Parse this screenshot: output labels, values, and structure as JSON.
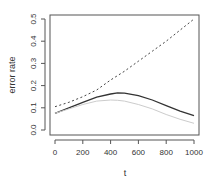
{
  "chart_data": {
    "type": "line",
    "title": "",
    "xlabel": "t",
    "ylabel": "error rate",
    "xlim": [
      0,
      1000
    ],
    "ylim": [
      0,
      0.5
    ],
    "xticks": [
      0,
      200,
      400,
      600,
      800,
      1000
    ],
    "yticks": [
      0.0,
      0.1,
      0.2,
      0.3,
      0.4,
      0.5
    ],
    "xtick_labels": [
      "0",
      "200",
      "400",
      "600",
      "800",
      "1000"
    ],
    "ytick_labels": [
      "0.0",
      "0.1",
      "0.2",
      "0.3",
      "0.4",
      "0.5"
    ],
    "grid": false,
    "legend": null,
    "x": [
      0,
      100,
      200,
      300,
      400,
      450,
      500,
      600,
      700,
      800,
      900,
      1000
    ],
    "series": [
      {
        "name": "dashed",
        "style": "dashed",
        "color": "#444444",
        "values": [
          0.105,
          0.125,
          0.15,
          0.18,
          0.225,
          0.245,
          0.265,
          0.31,
          0.355,
          0.4,
          0.45,
          0.5
        ]
      },
      {
        "name": "solid",
        "style": "solid",
        "color": "#333333",
        "values": [
          0.075,
          0.1,
          0.125,
          0.148,
          0.162,
          0.167,
          0.166,
          0.155,
          0.135,
          0.11,
          0.085,
          0.065
        ]
      },
      {
        "name": "light-gray",
        "style": "solid",
        "color": "#cccccc",
        "values": [
          0.075,
          0.095,
          0.115,
          0.13,
          0.135,
          0.134,
          0.13,
          0.115,
          0.095,
          0.07,
          0.048,
          0.03
        ]
      }
    ]
  }
}
